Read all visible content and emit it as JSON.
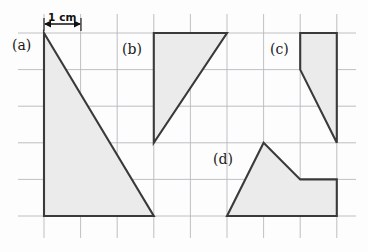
{
  "figure": {
    "background_color": "#fdfdfd",
    "scale_indicator": {
      "label": "1 cm",
      "label_x": 48,
      "label_y": 12,
      "arrow_y": 33,
      "arrow_x_start": 44,
      "arrow_x_end": 81,
      "color": "#111111"
    },
    "grid": {
      "line_color": "#b9b9bd",
      "line_width": 0.9,
      "cell_size_px": 36.6,
      "cell_size_cm": 1,
      "x_lines": [
        44,
        80.6,
        117.2,
        153.8,
        190.4,
        227,
        263.6,
        300.2,
        336.8
      ],
      "y_lines": [
        33,
        69.6,
        106.2,
        142.8,
        179.4,
        216
      ],
      "x_extent": [
        18,
        356
      ],
      "y_extent": [
        14,
        238
      ]
    },
    "shape_style": {
      "fill_color": "#ebebeb",
      "stroke_color": "#3a3a3a",
      "stroke_width": 2.1
    },
    "shapes": [
      {
        "id": "shape-a",
        "label": "(a)",
        "label_x": 12,
        "label_y": 38,
        "type": "right-triangle",
        "points": "44,33 44,216 153.8,216",
        "vertices_cm": [
          [
            0,
            0
          ],
          [
            0,
            5
          ],
          [
            3,
            5
          ]
        ],
        "base_cm": 3,
        "height_cm": 5
      },
      {
        "id": "shape-b",
        "label": "(b)",
        "label_x": 122,
        "label_y": 42,
        "type": "right-triangle",
        "points": "153.8,33 227,33 153.8,142.8",
        "vertices_cm": [
          [
            0,
            0
          ],
          [
            2,
            0
          ],
          [
            0,
            3
          ]
        ],
        "base_cm": 2,
        "height_cm": 3
      },
      {
        "id": "shape-c",
        "label": "(c)",
        "label_x": 270,
        "label_y": 42,
        "type": "quadrilateral",
        "points": "300.2,33 336.8,33 336.8,142.8 300.2,69.6",
        "vertices_cm": [
          [
            0,
            0
          ],
          [
            1,
            0
          ],
          [
            1,
            3
          ],
          [
            0,
            1
          ]
        ]
      },
      {
        "id": "shape-d",
        "label": "(d)",
        "label_x": 213,
        "label_y": 152,
        "type": "pentagon",
        "points": "227,216 263.6,142.8 300.2,179.4 336.8,179.4 336.8,216",
        "vertices_cm": [
          [
            0,
            2
          ],
          [
            1,
            0
          ],
          [
            2,
            1
          ],
          [
            3,
            1
          ],
          [
            3,
            2
          ]
        ]
      }
    ]
  }
}
